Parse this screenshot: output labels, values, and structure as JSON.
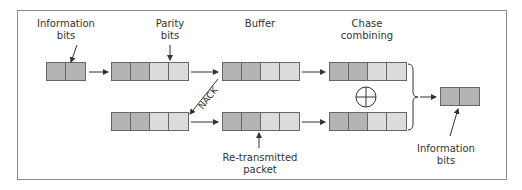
{
  "labels": {
    "info_in": [
      "Information",
      "bits"
    ],
    "parity": [
      "Parity",
      "bits"
    ],
    "buffer": "Buffer",
    "chase": [
      "Chase",
      "combining"
    ],
    "nack": "NACK",
    "retx": [
      "Re-transmitted",
      "packet"
    ],
    "info_out": [
      "Information",
      "bits"
    ]
  },
  "packets": {
    "info_in": [
      "dark",
      "dark"
    ],
    "encoded": [
      "dark",
      "dark",
      "light",
      "light"
    ],
    "buffer": [
      "dark",
      "dark",
      "light",
      "light"
    ],
    "chase_top": [
      "dark",
      "dark",
      "light",
      "light"
    ],
    "retx_src": [
      "dark",
      "dark",
      "light",
      "light"
    ],
    "retx_buf": [
      "dark",
      "dark",
      "light",
      "light"
    ],
    "chase_bottom": [
      "dark",
      "dark",
      "light",
      "light"
    ],
    "info_out": [
      "dark",
      "dark"
    ]
  },
  "colors": {
    "dark_cell": "#b4b4b4",
    "light_cell": "#dcdcdc",
    "line": "#333333",
    "frame": "#8a8a8a"
  },
  "symbols": {
    "combine": "xor-circle-plus"
  }
}
